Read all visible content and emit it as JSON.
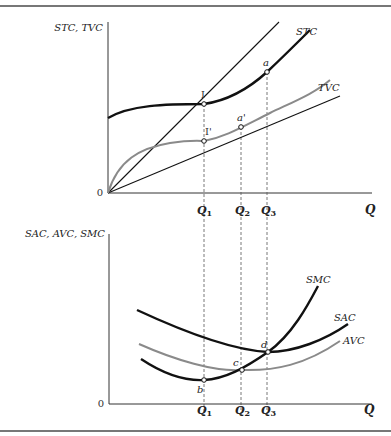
{
  "top_panel": {
    "y_axis_label": "STC, TVC",
    "x_axis_label": "Q",
    "origin_label": "0",
    "curves": {
      "stc": "STC",
      "tvc": "TVC"
    },
    "points": {
      "I": "I",
      "a": "a",
      "I_prime": "I'",
      "a_prime": "a'"
    },
    "ticks": [
      {
        "main": "Q",
        "sub": "1"
      },
      {
        "main": "Q",
        "sub": "2"
      },
      {
        "main": "Q",
        "sub": "3"
      }
    ]
  },
  "bottom_panel": {
    "y_axis_label": "SAC, AVC, SMC",
    "x_axis_label": "Q",
    "origin_label": "0",
    "curves": {
      "smc": "SMC",
      "sac": "SAC",
      "avc": "AVC"
    },
    "points": {
      "b": "b",
      "c": "c",
      "d": "d"
    },
    "ticks": [
      {
        "main": "Q",
        "sub": "1"
      },
      {
        "main": "Q",
        "sub": "2"
      },
      {
        "main": "Q",
        "sub": "3"
      }
    ]
  },
  "colors": {
    "black_curve": "#111111",
    "gray_curve": "#8a8a8a",
    "axis": "#333333",
    "rule": "#777777"
  }
}
